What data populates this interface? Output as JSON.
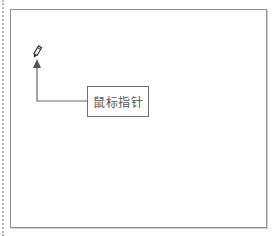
{
  "diagram": {
    "cursor_icon": "pencil-icon",
    "callout_label": "鼠标指针",
    "colors": {
      "frame_border": "#8f8f8f",
      "arrow": "#555555",
      "text": "#555555"
    }
  }
}
